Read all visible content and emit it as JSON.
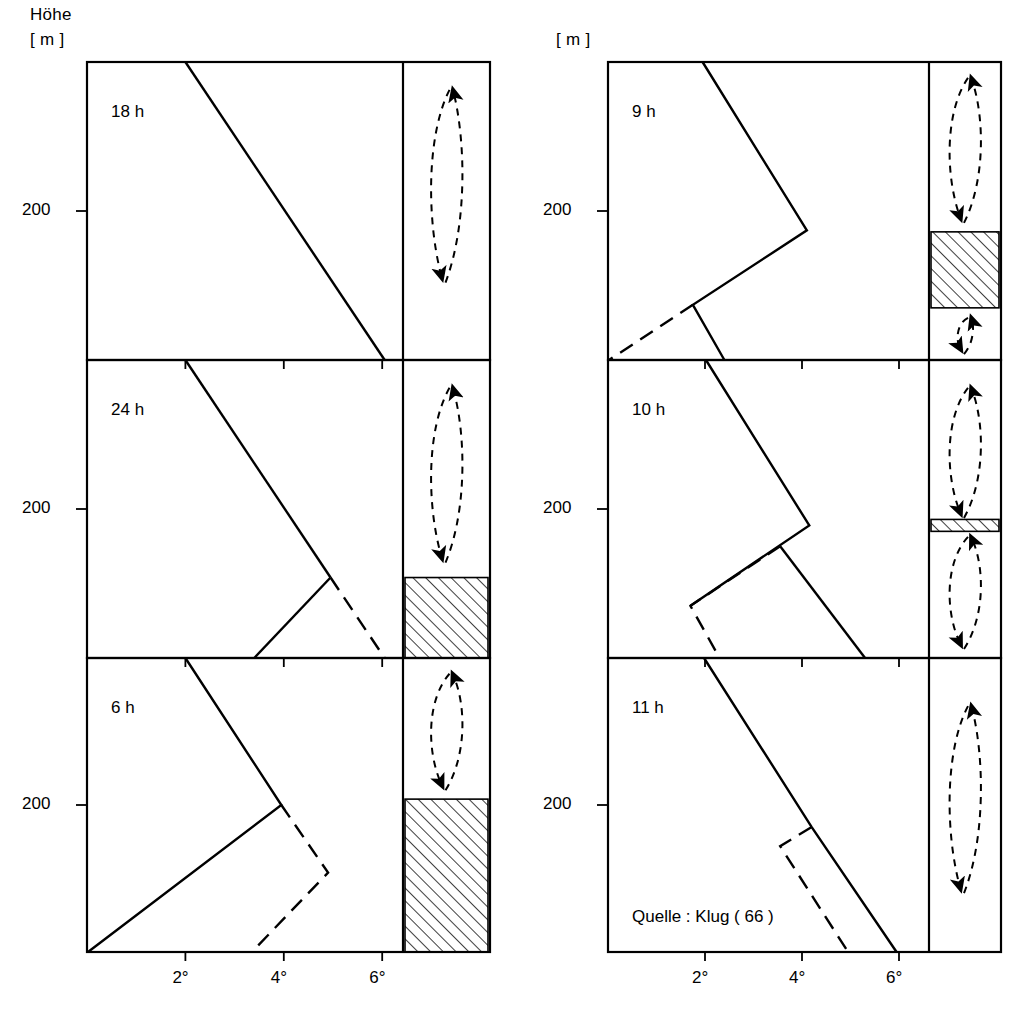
{
  "figure": {
    "yaxis_title_line1": "Höhe",
    "yaxis_title_line2": "[ m ]",
    "yaxis_title_right": "[ m ]",
    "source": "Quelle :  Klug ( 66 )",
    "line_color": "#000000",
    "background": "#ffffff"
  },
  "axes": {
    "x_ticks": [
      "2°",
      "4°",
      "6°"
    ],
    "x_tick_values": [
      2,
      4,
      6
    ],
    "y_ticks": [
      "200"
    ],
    "y_tick_values": [
      200
    ],
    "xlabel": "",
    "ylabel": "Höhe [ m ]",
    "xlim": [
      0,
      7.8
    ],
    "ylim_label": "200"
  },
  "columns": [
    {
      "name": "left-column",
      "yaxis_title_line1": "Höhe",
      "yaxis_title_line2": "[ m ]",
      "panels": [
        "18 h",
        "24 h",
        "6 h"
      ]
    },
    {
      "name": "right-column",
      "yaxis_title_line1": "[ m ]",
      "yaxis_title_line2": "",
      "panels": [
        "9 h",
        "10 h",
        "11 h"
      ]
    }
  ],
  "chart_data": {
    "type": "line",
    "xlabel": "Temperatur",
    "ylabel": "Höhe [ m ]",
    "xlim": [
      0,
      7.8
    ],
    "xticks": [
      2,
      4,
      6
    ],
    "xticklabels": [
      "2°",
      "4°",
      "6°"
    ],
    "yticks": [
      200
    ],
    "yticklabels": [
      "200"
    ],
    "grid": false,
    "legend": "none",
    "panels": [
      {
        "label": "18 h",
        "column": "left",
        "row": 0,
        "height_tick_frac": 0.5,
        "series": [
          {
            "name": "temperature-profile-solid",
            "style": "solid",
            "points": [
              [
                2.0,
                1.0
              ],
              [
                6.05,
                0.0
              ]
            ]
          }
        ],
        "circulation_cells": [
          {
            "name": "full-cell",
            "top_frac": 0.92,
            "bottom_frac": 0.26,
            "rotation": "counterclockwise",
            "up_arrow": "right",
            "down_arrow": "left"
          }
        ],
        "inversion_bands": []
      },
      {
        "label": "24 h",
        "column": "left",
        "row": 1,
        "height_tick_frac": 0.5,
        "series": [
          {
            "name": "temperature-profile-solid",
            "style": "solid",
            "points": [
              [
                2.0,
                1.0
              ],
              [
                4.95,
                0.27
              ]
            ]
          },
          {
            "name": "temperature-profile-solid-lower",
            "style": "solid",
            "points": [
              [
                4.95,
                0.27
              ],
              [
                3.4,
                0.0
              ]
            ]
          },
          {
            "name": "temperature-profile-dashed",
            "style": "dashed",
            "points": [
              [
                4.95,
                0.27
              ],
              [
                6.05,
                0.0
              ]
            ]
          }
        ],
        "circulation_cells": [
          {
            "name": "upper-cell",
            "top_frac": 0.92,
            "bottom_frac": 0.32,
            "rotation": "counterclockwise",
            "up_arrow": "right",
            "down_arrow": "left"
          }
        ],
        "inversion_bands": [
          {
            "name": "inversion-layer",
            "top_frac": 0.27,
            "bottom_frac": 0.0
          }
        ]
      },
      {
        "label": "6 h",
        "column": "left",
        "row": 2,
        "height_tick_frac": 0.5,
        "series": [
          {
            "name": "temperature-profile-solid",
            "style": "solid",
            "points": [
              [
                2.0,
                1.0
              ],
              [
                3.95,
                0.5
              ],
              [
                0.02,
                0.0
              ]
            ]
          },
          {
            "name": "temperature-profile-dashed",
            "style": "dashed",
            "points": [
              [
                3.95,
                0.5
              ],
              [
                4.9,
                0.27
              ],
              [
                3.35,
                0.0
              ]
            ]
          }
        ],
        "circulation_cells": [
          {
            "name": "upper-cell",
            "top_frac": 0.96,
            "bottom_frac": 0.55,
            "rotation": "clockwise",
            "up_arrow": "right",
            "down_arrow": "left"
          }
        ],
        "inversion_bands": [
          {
            "name": "inversion-layer",
            "top_frac": 0.52,
            "bottom_frac": 0.0
          }
        ]
      },
      {
        "label": "9 h",
        "column": "right",
        "row": 0,
        "height_tick_frac": 0.5,
        "series": [
          {
            "name": "temperature-profile-solid",
            "style": "solid",
            "points": [
              [
                1.95,
                1.0
              ],
              [
                4.1,
                0.435
              ],
              [
                1.75,
                0.185
              ],
              [
                2.4,
                0.0
              ]
            ]
          },
          {
            "name": "temperature-profile-dashed",
            "style": "dashed",
            "points": [
              [
                1.75,
                0.185
              ],
              [
                0.02,
                0.0
              ]
            ]
          }
        ],
        "circulation_cells": [
          {
            "name": "upper-cell",
            "top_frac": 0.96,
            "bottom_frac": 0.46,
            "rotation": "clockwise",
            "up_arrow": "right",
            "down_arrow": "left"
          },
          {
            "name": "lower-cell",
            "top_frac": 0.155,
            "bottom_frac": 0.02,
            "rotation": "clockwise",
            "up_arrow": "right",
            "down_arrow": "left"
          }
        ],
        "inversion_bands": [
          {
            "name": "inversion-layer",
            "top_frac": 0.43,
            "bottom_frac": 0.175
          }
        ]
      },
      {
        "label": "10 h",
        "column": "right",
        "row": 1,
        "height_tick_frac": 0.5,
        "series": [
          {
            "name": "temperature-profile-solid",
            "style": "solid",
            "points": [
              [
                2.02,
                1.0
              ],
              [
                4.15,
                0.445
              ],
              [
                1.7,
                0.175
              ]
            ]
          },
          {
            "name": "temperature-profile-solid-lower",
            "style": "solid",
            "points": [
              [
                3.55,
                0.375
              ],
              [
                5.3,
                0.0
              ]
            ]
          },
          {
            "name": "temperature-profile-dashed",
            "style": "dashed",
            "points": [
              [
                3.55,
                0.375
              ],
              [
                1.7,
                0.175
              ],
              [
                2.3,
                0.0
              ]
            ]
          }
        ],
        "circulation_cells": [
          {
            "name": "upper-cell",
            "top_frac": 0.92,
            "bottom_frac": 0.47,
            "rotation": "counterclockwise",
            "up_arrow": "right",
            "down_arrow": "left"
          },
          {
            "name": "lower-cell",
            "top_frac": 0.42,
            "bottom_frac": 0.03,
            "rotation": "counterclockwise",
            "up_arrow": "right",
            "down_arrow": "left"
          }
        ],
        "inversion_bands": [
          {
            "name": "inversion-layer",
            "top_frac": 0.465,
            "bottom_frac": 0.425
          }
        ]
      },
      {
        "label": "11 h",
        "column": "right",
        "row": 2,
        "height_tick_frac": 0.5,
        "series": [
          {
            "name": "temperature-profile-solid",
            "style": "solid",
            "points": [
              [
                1.98,
                1.0
              ],
              [
                4.2,
                0.425
              ],
              [
                5.95,
                0.0
              ]
            ]
          },
          {
            "name": "temperature-profile-dashed",
            "style": "dashed",
            "points": [
              [
                4.2,
                0.425
              ],
              [
                3.55,
                0.36
              ],
              [
                4.95,
                0.0
              ]
            ]
          }
        ],
        "circulation_cells": [
          {
            "name": "full-cell",
            "top_frac": 0.85,
            "bottom_frac": 0.2,
            "rotation": "counterclockwise",
            "up_arrow": "right",
            "down_arrow": "left"
          }
        ],
        "inversion_bands": []
      }
    ]
  }
}
